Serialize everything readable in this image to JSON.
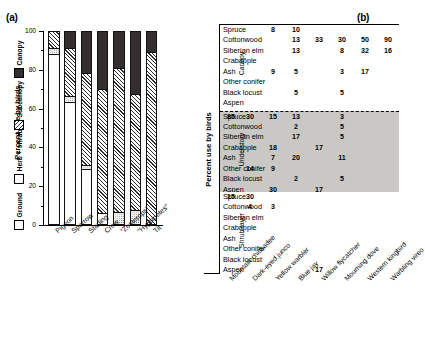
{
  "panel_a": {
    "tag": "(a)",
    "ytitle": "Percent use by birds",
    "legend": [
      {
        "key": "ground",
        "label": "Ground",
        "swatch": "white-square"
      },
      {
        "key": "herb",
        "label": "Herb + shrub",
        "swatch": "dotted-square"
      },
      {
        "key": "sub",
        "label": "Subcanopy",
        "swatch": "hatched-square"
      },
      {
        "key": "can",
        "label": "Canopy",
        "swatch": "black-square"
      }
    ],
    "yticks": [
      "0",
      "20",
      "40",
      "60",
      "80",
      "100"
    ],
    "ylim": [
      0,
      100
    ],
    "categories": [
      "Pigeon",
      "Sparrow",
      "Starling",
      "Crow",
      "“Zosterops”",
      "“Hypsipetes”",
      "Tit"
    ],
    "series": [
      {
        "name": "Ground",
        "values": [
          88,
          63,
          28,
          5,
          0,
          0,
          0
        ]
      },
      {
        "name": "Herb + shrub",
        "values": [
          3,
          3,
          2,
          0,
          6,
          7,
          0
        ]
      },
      {
        "name": "Subcanopy",
        "values": [
          9,
          25,
          48,
          65,
          75,
          60,
          89
        ]
      },
      {
        "name": "Canopy",
        "values": [
          0,
          9,
          22,
          30,
          19,
          33,
          11
        ]
      }
    ]
  },
  "panel_b": {
    "tag": "(b)",
    "ytitle": "Percent use by birds",
    "strata": [
      "Canopy",
      "Understory",
      "Shrub layer"
    ],
    "tree_species": [
      "Spruce",
      "Cottonwood",
      "Siberian elm",
      "Crabapple",
      "Ash",
      "Other conifer",
      "Black locust",
      "Aspen"
    ],
    "bird_species": [
      "Mountain chickadee",
      "Dark-eyed junco",
      "Yellow warbler",
      "Blue jay",
      "Willow flycatcher",
      "Mourning dove",
      "Western kingbird",
      "Warbling vireo"
    ],
    "matrix": {
      "Canopy": [
        [
          "",
          "",
          "8",
          "10",
          "",
          "",
          "",
          ""
        ],
        [
          "",
          "",
          "",
          "13",
          "33",
          "30",
          "50",
          "90"
        ],
        [
          "",
          "",
          "",
          "13",
          "",
          "8",
          "32",
          "16"
        ],
        [
          "",
          "",
          "",
          "",
          "",
          "",
          "",
          ""
        ],
        [
          "",
          "",
          "9",
          "5",
          "",
          "3",
          "17",
          ""
        ],
        [
          "",
          "",
          "",
          "",
          "",
          "",
          "",
          ""
        ],
        [
          "",
          "",
          "",
          "5",
          "",
          "5",
          "",
          ""
        ],
        [
          "",
          "",
          "",
          "",
          "",
          "",
          "",
          ""
        ]
      ],
      "Understory": [
        [
          "85",
          "30",
          "15",
          "13",
          "",
          "3",
          "",
          ""
        ],
        [
          "",
          "",
          "",
          "2",
          "",
          "5",
          "",
          ""
        ],
        [
          "",
          "",
          "",
          "17",
          "",
          "5",
          "",
          ""
        ],
        [
          "",
          "",
          "18",
          "",
          "17",
          "",
          "",
          ""
        ],
        [
          "",
          "",
          "7",
          "20",
          "",
          "11",
          "",
          ""
        ],
        [
          "",
          "14",
          "9",
          "",
          "",
          "",
          "",
          ""
        ],
        [
          "",
          "",
          "",
          "2",
          "",
          "5",
          "",
          ""
        ],
        [
          "",
          "",
          "30",
          "",
          "17",
          "",
          "",
          ""
        ]
      ],
      "Shrub layer": [
        [
          "15",
          "30",
          "",
          "",
          "",
          "",
          "",
          ""
        ],
        [
          "",
          "4",
          "3",
          "",
          "",
          "",
          "",
          ""
        ],
        [
          "",
          "",
          "",
          "",
          "",
          "",
          "",
          ""
        ],
        [
          "",
          "",
          "",
          "",
          "",
          "",
          "",
          ""
        ],
        [
          "",
          "",
          "",
          "",
          "",
          "",
          "",
          ""
        ],
        [
          "",
          "",
          "",
          "",
          "",
          "",
          "",
          ""
        ],
        [
          "",
          "",
          "",
          "",
          "",
          "",
          "",
          ""
        ],
        [
          "",
          "",
          "",
          "",
          "17",
          "",
          "",
          ""
        ]
      ]
    }
  },
  "chart_data": [
    {
      "type": "bar",
      "title": "(a) Percent use by birds by vertical stratum",
      "stacked": true,
      "xlabel": "",
      "ylabel": "Percent use by birds",
      "ylim": [
        0,
        100
      ],
      "yticks": [
        0,
        20,
        40,
        60,
        80,
        100
      ],
      "grid": false,
      "legend_position": "left-vertical",
      "categories": [
        "Pigeon",
        "Sparrow",
        "Starling",
        "Crow",
        "“Zosterops”",
        "“Hypsipetes”",
        "Tit"
      ],
      "series": [
        {
          "name": "Ground",
          "values": [
            88,
            63,
            28,
            5,
            0,
            0,
            0
          ],
          "fill": "white"
        },
        {
          "name": "Herb + shrub",
          "values": [
            3,
            3,
            2,
            0,
            6,
            7,
            0
          ],
          "fill": "dotted"
        },
        {
          "name": "Subcanopy",
          "values": [
            9,
            25,
            48,
            65,
            75,
            60,
            89
          ],
          "fill": "hatched"
        },
        {
          "name": "Canopy",
          "values": [
            0,
            9,
            22,
            30,
            19,
            33,
            11
          ],
          "fill": "black"
        }
      ]
    },
    {
      "type": "table",
      "title": "(b) Percent use by birds by tree species and stratum",
      "ylabel": "Percent use by birds",
      "row_groups": [
        "Canopy",
        "Understory",
        "Shrub layer"
      ],
      "rows": [
        "Spruce",
        "Cottonwood",
        "Siberian elm",
        "Crabapple",
        "Ash",
        "Other conifer",
        "Black locust",
        "Aspen"
      ],
      "columns": [
        "Mountain chickadee",
        "Dark-eyed junco",
        "Yellow warbler",
        "Blue jay",
        "Willow flycatcher",
        "Mourning dove",
        "Western kingbird",
        "Warbling vireo"
      ],
      "values": {
        "Canopy": [
          [
            null,
            null,
            8,
            10,
            null,
            null,
            null,
            null
          ],
          [
            null,
            null,
            null,
            13,
            33,
            30,
            50,
            90
          ],
          [
            null,
            null,
            null,
            13,
            null,
            8,
            32,
            16
          ],
          [
            null,
            null,
            null,
            null,
            null,
            null,
            null,
            null
          ],
          [
            null,
            null,
            9,
            5,
            null,
            3,
            17,
            null
          ],
          [
            null,
            null,
            null,
            null,
            null,
            null,
            null,
            null
          ],
          [
            null,
            null,
            null,
            5,
            null,
            5,
            null,
            null
          ],
          [
            null,
            null,
            null,
            null,
            null,
            null,
            null,
            null
          ]
        ],
        "Understory": [
          [
            85,
            30,
            15,
            13,
            null,
            3,
            null,
            null
          ],
          [
            null,
            null,
            null,
            2,
            null,
            5,
            null,
            null
          ],
          [
            null,
            null,
            null,
            17,
            null,
            5,
            null,
            null
          ],
          [
            null,
            null,
            18,
            null,
            17,
            null,
            null,
            null
          ],
          [
            null,
            null,
            7,
            20,
            null,
            11,
            null,
            null
          ],
          [
            null,
            14,
            9,
            null,
            null,
            null,
            null,
            null
          ],
          [
            null,
            null,
            null,
            2,
            null,
            5,
            null,
            null
          ],
          [
            null,
            null,
            30,
            null,
            17,
            null,
            null,
            null
          ]
        ],
        "Shrub layer": [
          [
            15,
            30,
            null,
            null,
            null,
            null,
            null,
            null
          ],
          [
            null,
            4,
            3,
            null,
            null,
            null,
            null,
            null
          ],
          [
            null,
            null,
            null,
            null,
            null,
            null,
            null,
            null
          ],
          [
            null,
            null,
            null,
            null,
            null,
            null,
            null,
            null
          ],
          [
            null,
            null,
            null,
            null,
            null,
            null,
            null,
            null
          ],
          [
            null,
            null,
            null,
            null,
            null,
            null,
            null,
            null
          ],
          [
            null,
            null,
            null,
            null,
            null,
            null,
            null,
            null
          ],
          [
            null,
            null,
            null,
            null,
            17,
            null,
            null,
            null
          ]
        ]
      }
    }
  ]
}
